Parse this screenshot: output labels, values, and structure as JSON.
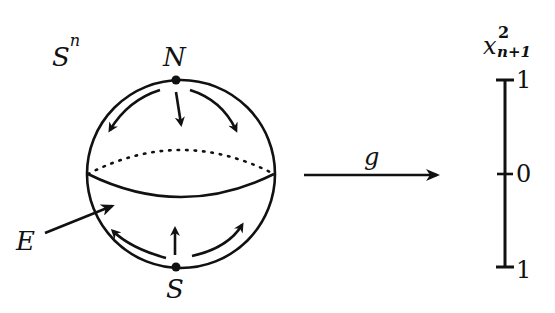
{
  "diagram": {
    "type": "diagram",
    "sphere": {
      "label_base": "S",
      "label_sup": "n",
      "north_pole": "N",
      "south_pole": "S",
      "equator_label": "E"
    },
    "map": {
      "label": "g"
    },
    "axis": {
      "label_base": "x",
      "label_sup": "2",
      "label_sub": "n+1",
      "ticks": [
        "1",
        "0",
        "1"
      ]
    },
    "colors": {
      "ink": "#111111",
      "background": "#ffffff"
    }
  }
}
